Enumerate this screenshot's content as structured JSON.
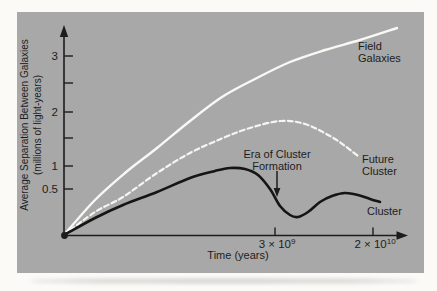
{
  "figure": {
    "panel_background": "#a8a8a8",
    "page_background": "#fbfaf7",
    "ink_color": "#1c1c1c",
    "white_curve_color": "#f7f7f4"
  },
  "chart_data": {
    "type": "line",
    "title": "",
    "xlabel": "Time (years)",
    "ylabel": "Average Separation Between Galaxies (millions of light-years)",
    "ylabel_lines": [
      "Average Separation Between Galaxies",
      "(millions of light-years)"
    ],
    "x_axis": {
      "ticks": [
        {
          "mantissa": "3 × 10",
          "exponent": "9",
          "value_years": 3000000000.0,
          "x_px": 275
        },
        {
          "mantissa": "2 × 10",
          "exponent": "10",
          "value_years": 20000000000.0,
          "x_px": 373
        }
      ]
    },
    "y_axis": {
      "ticks": [
        {
          "label": "3",
          "value": 3,
          "y_px": 56
        },
        {
          "label": "",
          "value": 2.5,
          "y_px": 83
        },
        {
          "label": "2",
          "value": 2,
          "y_px": 112
        },
        {
          "label": "",
          "value": 1.5,
          "y_px": 138
        },
        {
          "label": "1",
          "value": 1,
          "y_px": 166
        },
        {
          "label": "0.5",
          "value": 0.5,
          "y_px": 189
        }
      ]
    },
    "annotation": {
      "lines": [
        "Era of Cluster",
        "Formation"
      ],
      "arrow_points_to": "dip of Cluster curve near 3 × 10⁹ years"
    },
    "series": [
      {
        "name": "Field Galaxies",
        "label_lines": [
          "Field",
          "Galaxies"
        ],
        "style": "solid",
        "color": "#f8f8f5",
        "approx_data": {
          "start_separation": 0,
          "separation_at_3e9_yr": 2.9,
          "separation_at_2e10_yr": 3.35,
          "end_separation": 3.5,
          "trend": "monotonically rising, decelerating"
        },
        "points_px": [
          [
            64,
            235
          ],
          [
            95,
            200
          ],
          [
            125,
            173
          ],
          [
            157,
            148
          ],
          [
            190,
            121
          ],
          [
            222,
            97
          ],
          [
            255,
            79
          ],
          [
            290,
            62
          ],
          [
            325,
            50
          ],
          [
            360,
            40
          ],
          [
            397,
            28
          ]
        ]
      },
      {
        "name": "Future Cluster",
        "label_lines": [
          "Future",
          "Cluster"
        ],
        "style": "dashed",
        "color": "#f5f5f1",
        "approx_data": {
          "start_separation": 0,
          "peak_separation": 1.8,
          "separation_at_3e9_yr": 1.8,
          "end_separation": 1.2,
          "trend": "rises, peaks near 1.8, turns over and falls"
        },
        "points_px": [
          [
            64,
            235
          ],
          [
            95,
            212
          ],
          [
            123,
            197
          ],
          [
            157,
            173
          ],
          [
            190,
            153
          ],
          [
            223,
            138
          ],
          [
            250,
            128
          ],
          [
            280,
            121
          ],
          [
            305,
            124
          ],
          [
            330,
            136
          ],
          [
            345,
            146
          ],
          [
            358,
            156
          ]
        ]
      },
      {
        "name": "Cluster",
        "label_lines": [
          "Cluster"
        ],
        "style": "solid",
        "color": "#151515",
        "approx_data": {
          "start_separation": 0,
          "first_peak_separation": 0.95,
          "dip_separation": 0.2,
          "dip_at_years": 3000000000.0,
          "second_peak_separation": 0.5,
          "end_separation": 0.35,
          "trend": "rises, dips sharply during cluster formation, partially recovers, slowly declines"
        },
        "points_px": [
          [
            64,
            235
          ],
          [
            95,
            218
          ],
          [
            123,
            205
          ],
          [
            157,
            192
          ],
          [
            190,
            178
          ],
          [
            215,
            171
          ],
          [
            230,
            168
          ],
          [
            245,
            169
          ],
          [
            258,
            175
          ],
          [
            270,
            189
          ],
          [
            280,
            206
          ],
          [
            290,
            215
          ],
          [
            298,
            217
          ],
          [
            308,
            212
          ],
          [
            320,
            202
          ],
          [
            332,
            196
          ],
          [
            345,
            193
          ],
          [
            358,
            195
          ],
          [
            370,
            199
          ],
          [
            380,
            202
          ]
        ]
      }
    ]
  }
}
